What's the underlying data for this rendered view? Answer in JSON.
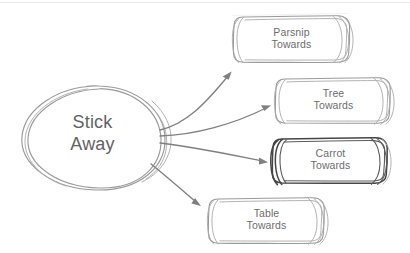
{
  "diagram": {
    "style": "hand-drawn sketch",
    "background_color": "#ffffff",
    "stroke_color": "#9a9a9a",
    "emphasis_stroke_color": "#454545",
    "arrow_color": "#808080",
    "text_color": "#6d6d6d",
    "top_rule_color": "#e6e6e6"
  },
  "center_node": {
    "name": "stick-away",
    "shape": "ellipse",
    "line1": "Stick",
    "line2": "Away"
  },
  "nodes": [
    {
      "name": "parsnip-towards",
      "shape": "rounded-rectangle",
      "line1": "Parsnip",
      "line2": "Towards",
      "emphasized": false
    },
    {
      "name": "tree-towards",
      "shape": "rounded-rectangle",
      "line1": "Tree",
      "line2": "Towards",
      "emphasized": false
    },
    {
      "name": "carrot-towards",
      "shape": "rounded-rectangle",
      "line1": "Carrot",
      "line2": "Towards",
      "emphasized": true
    },
    {
      "name": "table-towards",
      "shape": "rounded-rectangle",
      "line1": "Table",
      "line2": "Towards",
      "emphasized": false
    }
  ],
  "connectors": [
    {
      "name": "arrow-to-parsnip",
      "from": "stick-away",
      "to": "parsnip-towards"
    },
    {
      "name": "arrow-to-tree",
      "from": "stick-away",
      "to": "tree-towards"
    },
    {
      "name": "arrow-to-carrot",
      "from": "stick-away",
      "to": "carrot-towards"
    },
    {
      "name": "arrow-to-table",
      "from": "stick-away",
      "to": "table-towards"
    }
  ]
}
